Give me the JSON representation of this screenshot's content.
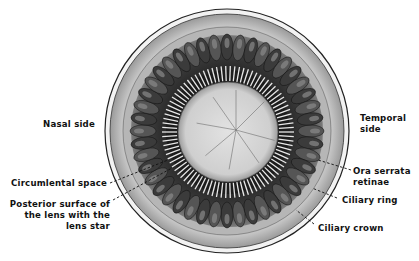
{
  "diagram": {
    "labels": {
      "nasal_side": "Nasal side",
      "temporal_side_1": "Temporal",
      "temporal_side_2": "side",
      "circumlental_space": "Circumlental space",
      "posterior_surface_1": "Posterior surface of",
      "posterior_surface_2": "the lens with the",
      "posterior_surface_3": "lens star",
      "ora_serrata_1": "Ora serrata",
      "ora_serrata_2": "retinae",
      "ciliary_ring": "Ciliary ring",
      "ciliary_crown": "Ciliary crown"
    },
    "colors": {
      "background": "#ffffff",
      "outer_ring": "#d9d9d9",
      "ciliary_ring_fill": "#b8b8b8",
      "processes_dark": "#2a2a2a",
      "processes_mid": "#6a6a6a",
      "lens_fill": "#d6d6d6",
      "line": "#1a1a1a"
    }
  }
}
